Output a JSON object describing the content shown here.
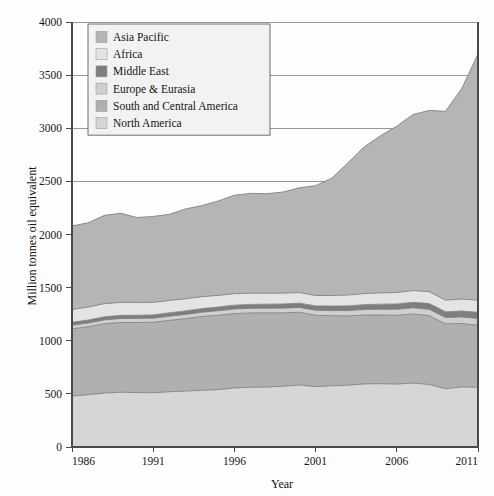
{
  "chart_data": {
    "type": "area",
    "stacked": true,
    "title": "",
    "xlabel": "Year",
    "ylabel": "Million tonnes oil equivalent",
    "xlim": [
      1986,
      2011
    ],
    "ylim": [
      0,
      4000
    ],
    "xticks": [
      1986,
      1991,
      1996,
      2001,
      2006,
      2011
    ],
    "yticks": [
      0,
      500,
      1000,
      1500,
      2000,
      2500,
      3000,
      3500,
      4000
    ],
    "grid": true,
    "legend_position": "top-left",
    "x": [
      1986,
      1987,
      1988,
      1989,
      1990,
      1991,
      1992,
      1993,
      1994,
      1995,
      1996,
      1997,
      1998,
      1999,
      2000,
      2001,
      2002,
      2003,
      2004,
      2005,
      2006,
      2007,
      2008,
      2009,
      2010,
      2011
    ],
    "series": [
      {
        "name": "North America",
        "color": "#d6d6d6",
        "values": [
          480,
          492,
          508,
          516,
          512,
          510,
          520,
          526,
          534,
          540,
          556,
          562,
          564,
          572,
          584,
          568,
          576,
          582,
          594,
          596,
          592,
          602,
          588,
          548,
          566,
          562
        ]
      },
      {
        "name": "South and Central America",
        "color": "#b0b0b0",
        "values": [
          632,
          640,
          652,
          656,
          660,
          664,
          672,
          682,
          694,
          700,
          700,
          700,
          698,
          690,
          684,
          672,
          660,
          652,
          648,
          646,
          648,
          650,
          648,
          612,
          596,
          584
        ]
      },
      {
        "name": "Europe & Eurasia",
        "color": "#cfcfcf",
        "values": [
          34,
          35,
          36,
          37,
          38,
          38,
          39,
          40,
          41,
          42,
          43,
          43,
          44,
          45,
          46,
          47,
          48,
          50,
          52,
          54,
          56,
          58,
          60,
          58,
          62,
          64
        ]
      },
      {
        "name": "Middle East",
        "color": "#7e7e7e",
        "values": [
          28,
          28,
          29,
          30,
          30,
          31,
          32,
          33,
          34,
          35,
          36,
          37,
          38,
          39,
          40,
          41,
          42,
          44,
          46,
          48,
          50,
          52,
          54,
          54,
          56,
          58
        ]
      },
      {
        "name": "Africa",
        "color": "#e4e4e4",
        "values": [
          120,
          122,
          124,
          122,
          120,
          118,
          116,
          114,
          112,
          110,
          108,
          106,
          104,
          102,
          100,
          98,
          100,
          102,
          104,
          106,
          108,
          110,
          112,
          110,
          112,
          114
        ]
      },
      {
        "name": "Asia Pacific",
        "color": "#b5b5b5",
        "values": [
          786,
          793,
          831,
          839,
          800,
          809,
          811,
          846,
          857,
          888,
          927,
          939,
          936,
          952,
          986,
          1034,
          1104,
          1246,
          1382,
          1480,
          1566,
          1658,
          1706,
          1778,
          1982,
          2318
        ]
      }
    ],
    "totals": [
      2080,
      2110,
      2180,
      2200,
      2160,
      2170,
      2190,
      2241,
      2272,
      2315,
      2370,
      2387,
      2384,
      2400,
      2440,
      2460,
      2530,
      2676,
      2826,
      2930,
      3020,
      3130,
      3168,
      3160,
      3374,
      3700
    ]
  },
  "axes": {
    "ylabel": "Million tonnes oil equivalent",
    "xlabel": "Year",
    "ytick_labels": [
      "0",
      "500",
      "1000",
      "1500",
      "2000",
      "2500",
      "3000",
      "3500",
      "4000"
    ],
    "xtick_labels": [
      "1986",
      "1991",
      "1996",
      "2001",
      "2006",
      "2011"
    ]
  },
  "legend": {
    "items": [
      {
        "label": "Asia Pacific",
        "color": "#b5b5b5"
      },
      {
        "label": "Africa",
        "color": "#e4e4e4"
      },
      {
        "label": "Middle East",
        "color": "#7e7e7e"
      },
      {
        "label": "Europe & Eurasia",
        "color": "#cfcfcf"
      },
      {
        "label": "South and Central America",
        "color": "#b0b0b0"
      },
      {
        "label": "North America",
        "color": "#d6d6d6"
      }
    ]
  },
  "style": {
    "background": "#fdfdfd",
    "gridline_color": "#8d8d8d",
    "axis_color": "#4a4a4a",
    "band_edge_color": "#7d7d7d",
    "legend_bg": "#f2f2f2",
    "legend_border": "#6e6e6e"
  }
}
